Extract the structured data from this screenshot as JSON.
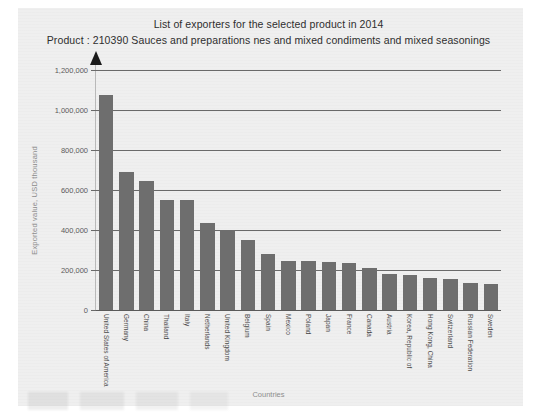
{
  "chart_data": {
    "type": "bar",
    "title": "List of exporters for the selected product in 2014",
    "subtitle": "Product : 210390 Sauces and preparations nes and mixed condiments and mixed seasonings",
    "xlabel": "Countries",
    "ylabel": "Exported value, USD thousand",
    "ylim": [
      0,
      1200000
    ],
    "grid": true,
    "legend": "none",
    "bar_color": "#6e6e6e",
    "ytick_labels": [
      "0",
      "200,000",
      "400,000",
      "600,000",
      "800,000",
      "1,000,000",
      "1,200,000"
    ],
    "ytick_values": [
      0,
      200000,
      400000,
      600000,
      800000,
      1000000,
      1200000
    ],
    "categories": [
      "United States of America",
      "Germany",
      "China",
      "Thailand",
      "Italy",
      "Netherlands",
      "United Kingdom",
      "Belgium",
      "Spain",
      "Mexico",
      "Poland",
      "Japan",
      "France",
      "Canada",
      "Austria",
      "Korea, Republic of",
      "Hong Kong, China",
      "Switzerland",
      "Russian Federation",
      "Sweden"
    ],
    "values": [
      1075000,
      690000,
      645000,
      550000,
      550000,
      435000,
      400000,
      350000,
      280000,
      247000,
      243000,
      240000,
      235000,
      212000,
      180000,
      175000,
      160000,
      155000,
      135000,
      128000
    ]
  }
}
